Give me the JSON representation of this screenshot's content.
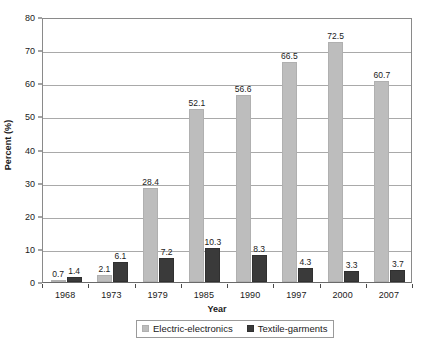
{
  "chart_data": {
    "type": "bar",
    "title": "",
    "subtitle": "",
    "xlabel": "Year",
    "ylabel": "Percent (%)",
    "categories": [
      "1968",
      "1973",
      "1979",
      "1985",
      "1990",
      "1997",
      "2000",
      "2007"
    ],
    "series": [
      {
        "name": "Electric-electronics",
        "color": "#bdbdbd",
        "values": [
          0.7,
          2.1,
          28.4,
          52.1,
          56.6,
          66.5,
          72.5,
          60.7
        ],
        "labels": [
          "0.7",
          "2.1",
          "28.4",
          "52.1",
          "56.6",
          "66.5",
          "72.5",
          "60.7"
        ]
      },
      {
        "name": "Textile-garments",
        "color": "#3a3a3a",
        "values": [
          1.4,
          6.1,
          7.2,
          10.3,
          8.3,
          4.3,
          3.3,
          3.7
        ],
        "labels": [
          "1.4",
          "6.1",
          "7.2",
          "10.3",
          "8.3",
          "4.3",
          "3.3",
          "3.7"
        ]
      }
    ],
    "ylim": [
      0,
      80
    ],
    "yticks": [
      0,
      10,
      20,
      30,
      40,
      50,
      60,
      70,
      80
    ],
    "ytick_labels": [
      "0",
      "10",
      "20",
      "30",
      "40",
      "50",
      "60",
      "70",
      "80"
    ],
    "grid": "horizontal",
    "legend_position": "bottom-center",
    "legend_entries": [
      "Electric-electronics",
      "Textile-garments"
    ]
  }
}
